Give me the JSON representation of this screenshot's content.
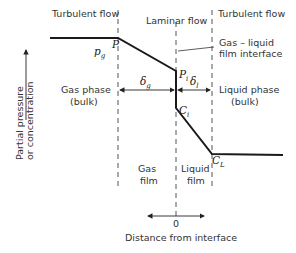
{
  "diagram": {
    "regions": {
      "left_top": "Turbulent flow",
      "center_top": "Laminar flow",
      "right_top": "Turbulent flow"
    },
    "labels": {
      "interface_line1": "Gas – liquid",
      "interface_line2": "film interface",
      "gas_bulk_line1": "Gas phase",
      "gas_bulk_line2": "(bulk)",
      "liquid_bulk_line1": "Liquid phase",
      "liquid_bulk_line2": "(bulk)",
      "gas_film_line1": "Gas",
      "gas_film_line2": "film",
      "liquid_film_line1": "Liquid",
      "liquid_film_line2": "film",
      "y_axis_line1": "Partial pressure",
      "y_axis_line2": "or concentration",
      "x_axis": "Distance from interface",
      "origin": "0"
    },
    "symbols": {
      "p_g": "p",
      "p_g_sub": "g",
      "P": "P",
      "p_i": "P",
      "p_i_sub": "i",
      "c_i": "C",
      "c_i_sub": "i",
      "c_l": "C",
      "c_l_sub": "L",
      "delta_g": "δ",
      "delta_g_sub": "g",
      "delta_l": "δ",
      "delta_l_sub": "l"
    },
    "colors": {
      "line": "#1a1a1a",
      "dashed": "#555555",
      "text": "#333333"
    }
  }
}
